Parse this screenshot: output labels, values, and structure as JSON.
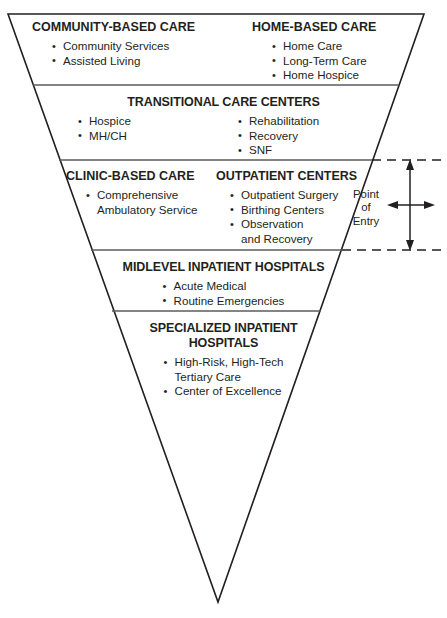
{
  "diagram": {
    "shape": "inverted-triangle",
    "colors": {
      "line": "#231f20",
      "text": "#231f20",
      "background": "#ffffff"
    },
    "annotation": {
      "point_of_entry": {
        "line1": "Point",
        "line2": "of",
        "line3": "Entry"
      }
    },
    "tiers": [
      {
        "id": "community",
        "layout": "two-headings",
        "columns": [
          {
            "heading": "COMMUNITY-BASED CARE",
            "bullets": [
              "Community Services",
              "Assisted Living"
            ]
          },
          {
            "heading": "HOME-BASED CARE",
            "bullets": [
              "Home Care",
              "Long-Term Care",
              "Home Hospice"
            ]
          }
        ]
      },
      {
        "id": "transitional",
        "layout": "single-heading-two-columns",
        "heading": "TRANSITIONAL CARE CENTERS",
        "columns": [
          {
            "bullets": [
              "Hospice",
              "MH/CH"
            ]
          },
          {
            "bullets": [
              "Rehabilitation",
              "Recovery",
              "SNF"
            ]
          }
        ]
      },
      {
        "id": "clinic",
        "layout": "two-headings",
        "columns": [
          {
            "heading": "CLINIC-BASED CARE",
            "bullets": [
              "Comprehensive\nAmbulatory Service"
            ]
          },
          {
            "heading": "OUTPATIENT CENTERS",
            "bullets": [
              "Outpatient Surgery",
              "Birthing Centers",
              "Observation\nand Recovery"
            ]
          }
        ]
      },
      {
        "id": "midlevel",
        "layout": "single-heading-centered",
        "heading": "MIDLEVEL INPATIENT HOSPITALS",
        "bullets": [
          "Acute Medical",
          "Routine Emergencies"
        ]
      },
      {
        "id": "specialized",
        "layout": "single-heading-centered",
        "heading_line1": "SPECIALIZED INPATIENT",
        "heading_line2": "HOSPITALS",
        "bullets": [
          "High-Risk, High-Tech\nTertiary Care",
          "Center of Excellence"
        ]
      }
    ]
  }
}
